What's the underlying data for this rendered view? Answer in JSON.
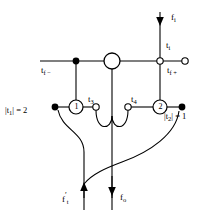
{
  "figure": {
    "type": "signal-flow-graph",
    "background_color": "#ffffff",
    "stroke_color": "#000000"
  },
  "labels": {
    "f_in": "f",
    "f_in_sub": "i",
    "t_in": "t",
    "t_in_sub": "i",
    "t_fminus": "t",
    "t_fminus_sub": "f −",
    "t_fplus": "t",
    "t_fplus_sub": "f +",
    "t3": "t",
    "t3_sub": "3",
    "t4": "t",
    "t4_sub": "4",
    "mag_t1": "|t",
    "mag_t1_sub": "1",
    "mag_t1_val": "| = 2",
    "mag_t2": "|t",
    "mag_t2_sub": "2",
    "mag_t2_val": "| = 1",
    "f_t": "f",
    "f_t_sub": "t",
    "f_t_prime": "′",
    "f_o": "f",
    "f_o_sub": "o"
  },
  "nodes": {
    "node1_label": "1",
    "node2_label": "2"
  },
  "arrows": {
    "input_top": "down",
    "output_left": "up",
    "output_center": "down"
  }
}
